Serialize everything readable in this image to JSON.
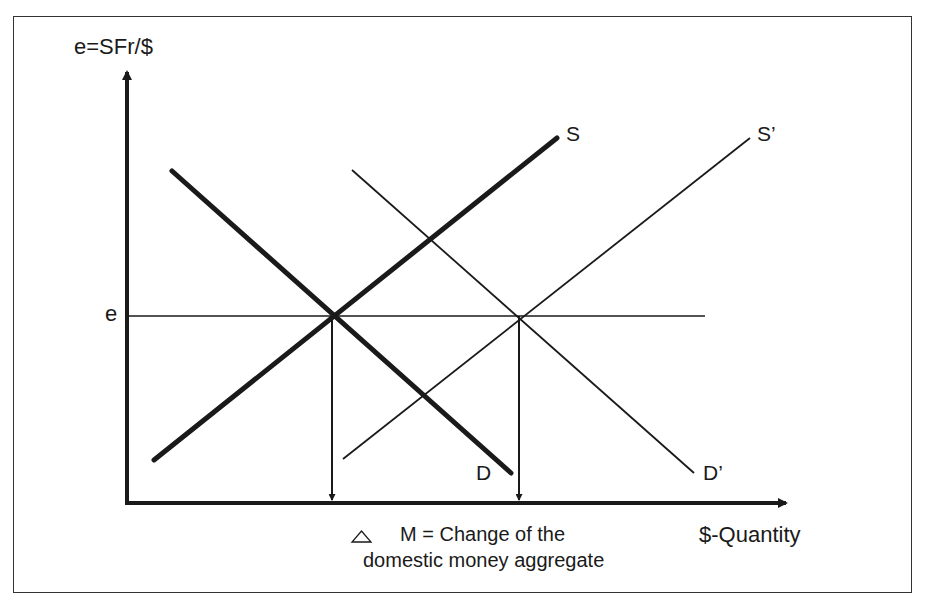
{
  "diagram": {
    "y_axis_label": "e=SFr/$",
    "x_axis_label": "$-Quantity",
    "equilibrium_rate_label": "e",
    "curves": [
      {
        "name": "S",
        "type": "supply",
        "weight": "thick",
        "label": "S"
      },
      {
        "name": "D",
        "type": "demand",
        "weight": "thick",
        "label": "D"
      },
      {
        "name": "S'",
        "type": "supply",
        "weight": "thin",
        "label": "S’"
      },
      {
        "name": "D'",
        "type": "demand",
        "weight": "thin",
        "label": "D’"
      }
    ],
    "note": {
      "symbol": "△",
      "line1": "M = Change of the",
      "line2": "domestic money aggregate"
    },
    "colors": {
      "ink": "#1a1a1a",
      "background": "#ffffff",
      "border": "#333333"
    }
  }
}
